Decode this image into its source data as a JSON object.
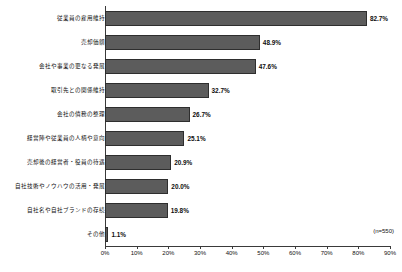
{
  "chart_data": {
    "type": "bar",
    "orientation": "horizontal",
    "title": "",
    "xlabel": "",
    "ylabel": "",
    "xlim": [
      0,
      90
    ],
    "grid": false,
    "legend": false,
    "note": "(n=550)",
    "categories": [
      "従業員の雇用維持",
      "売却価額",
      "会社や事業の更なる発展",
      "取引先との関係維持",
      "会社の債務の整理",
      "経営陣や従業員の人柄や意向",
      "売却後の経営者・役員の待遇",
      "自社技術やノウハウの活用・発展",
      "自社名や自社ブランドの存続",
      "その他"
    ],
    "values": [
      82.7,
      48.9,
      47.6,
      32.7,
      26.7,
      25.1,
      20.9,
      20.0,
      19.8,
      1.1
    ],
    "value_labels": [
      "82.7%",
      "48.9%",
      "47.6%",
      "32.7%",
      "26.7%",
      "25.1%",
      "20.9%",
      "20.0%",
      "19.8%",
      "1.1%"
    ],
    "xticks": [
      0,
      10,
      20,
      30,
      40,
      50,
      60,
      70,
      80,
      90
    ],
    "xtick_labels": [
      "0%",
      "10%",
      "20%",
      "30%",
      "40%",
      "50%",
      "60%",
      "70%",
      "80%",
      "90%"
    ],
    "bar_color": "#5c5c5c",
    "bar_edge_color": "#2e2e2e",
    "axis_color": "#3a3a3a"
  }
}
